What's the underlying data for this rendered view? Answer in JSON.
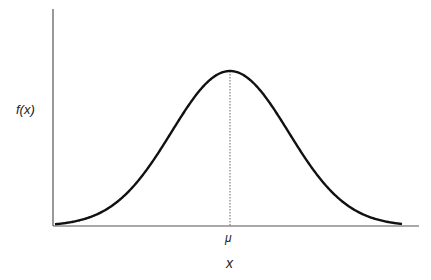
{
  "chart_data": {
    "type": "line",
    "title": "",
    "xlabel": "x",
    "ylabel": "f(x)",
    "annotations": [
      {
        "text": "μ",
        "position": "x-axis tick at curve peak",
        "style": "dotted vertical line from peak to x-axis"
      }
    ],
    "distribution": "normal",
    "mean_label": "μ",
    "series": [
      {
        "name": "f(x)",
        "description": "Bell-shaped normal density curve, symmetric about μ, spanning roughly μ-3σ to μ+3σ"
      }
    ],
    "x": [
      -3,
      -2.5,
      -2,
      -1.5,
      -1,
      -0.5,
      0,
      0.5,
      1,
      1.5,
      2,
      2.5,
      3
    ],
    "values": [
      0.011,
      0.044,
      0.135,
      0.325,
      0.607,
      0.882,
      1.0,
      0.882,
      0.607,
      0.325,
      0.135,
      0.044,
      0.011
    ],
    "xlim": [
      -3,
      3
    ],
    "ylim": [
      0,
      1.4
    ],
    "grid": false,
    "legend": "none",
    "ticks": {
      "x": [
        "μ"
      ],
      "y": []
    }
  },
  "labels": {
    "ylabel": "f(x)",
    "xlabel": "x",
    "mu": "μ"
  },
  "layout": {
    "origin_px": [
      53,
      226
    ],
    "x_axis_end_px": 419,
    "y_axis_top_px": 9,
    "peak_px": [
      230,
      71
    ],
    "sigma_px": 58.5,
    "curve_start_px": 55,
    "curve_end_px": 402,
    "colors": {
      "axis": "#555555",
      "curve": "#111111",
      "dotted": "#666666"
    }
  }
}
